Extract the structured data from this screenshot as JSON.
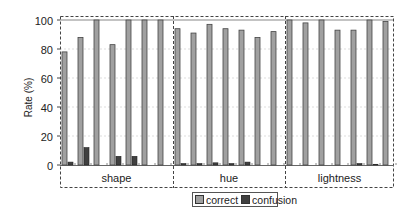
{
  "chart_data": {
    "type": "bar",
    "title": "",
    "xlabel": "",
    "ylabel": "Rate (%)",
    "ylim": [
      0,
      100
    ],
    "yticks": [
      0,
      20,
      40,
      60,
      80,
      100
    ],
    "grid": true,
    "legend_position": "bottom",
    "groups": [
      {
        "name": "shape",
        "categories": [
          "1",
          "2",
          "3",
          "4",
          "5",
          "6",
          "7"
        ],
        "series": [
          {
            "name": "correct",
            "values": [
              78,
              88,
              100,
              83,
              100,
              100,
              100
            ]
          },
          {
            "name": "confusion",
            "values": [
              2,
              12,
              0,
              6,
              6,
              0,
              0
            ]
          }
        ]
      },
      {
        "name": "hue",
        "categories": [
          "1",
          "2",
          "3",
          "4",
          "5",
          "6",
          "7"
        ],
        "series": [
          {
            "name": "correct",
            "values": [
              94,
              91,
              97,
              94,
              93,
              88,
              92
            ]
          },
          {
            "name": "confusion",
            "values": [
              1,
              1,
              1.5,
              1,
              2,
              0,
              0
            ]
          }
        ]
      },
      {
        "name": "lightness",
        "categories": [
          "1",
          "2",
          "3",
          "4",
          "5",
          "6",
          "7"
        ],
        "series": [
          {
            "name": "correct",
            "values": [
              100,
              98,
              100,
              93,
              93,
              100,
              99
            ]
          },
          {
            "name": "confusion",
            "values": [
              0,
              0,
              0,
              0,
              1,
              0.5,
              0
            ]
          }
        ]
      }
    ],
    "legend": [
      "correct",
      "confusion"
    ],
    "colors": {
      "correct": "#a0a0a0",
      "confusion": "#404040"
    }
  },
  "labels": {
    "ylabel": "Rate (%)",
    "yticks": [
      "100",
      "80",
      "60",
      "40",
      "20",
      "0"
    ],
    "legend_correct": "correct",
    "legend_confusion": "confusion",
    "sections": [
      "shape",
      "hue",
      "lightness"
    ]
  }
}
